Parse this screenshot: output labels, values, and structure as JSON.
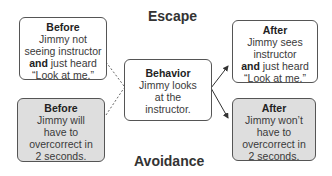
{
  "labels": {
    "escape": "Escape",
    "avoidance": "Avoidance"
  },
  "boxes": {
    "before_escape": {
      "title": "Before",
      "line1": "Jimmy not",
      "line2": "seeing instructor",
      "bold": "and",
      "line3_rest": " just heard",
      "line4": "“Look at me.”"
    },
    "before_avoid": {
      "title": "Before",
      "line1": "Jimmy will",
      "line2": "have to",
      "line3": "overcorrect in",
      "line4": "2 seconds."
    },
    "behavior": {
      "title": "Behavior",
      "line1": "Jimmy looks",
      "line2": "at the",
      "line3": "instructor."
    },
    "after_escape": {
      "title": "After",
      "line1": "Jimmy sees",
      "line2": "instructor",
      "bold": "and",
      "line3_rest": " just heard",
      "line4": "“Look at me.”"
    },
    "after_avoid": {
      "title": "After",
      "line1": "Jimmy won’t",
      "line2": "have to",
      "line3": "overcorrect in",
      "line4": "2 seconds."
    }
  },
  "colors": {
    "shaded": "#dedede",
    "border": "#555555"
  }
}
